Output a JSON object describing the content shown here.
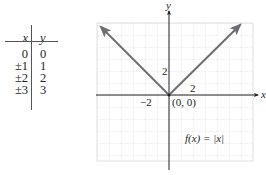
{
  "table": {
    "headers": {
      "x": "x",
      "y": "y"
    },
    "rows": [
      {
        "x": "0",
        "y": "0"
      },
      {
        "x": "±1",
        "y": "1"
      },
      {
        "x": "±2",
        "y": "2"
      },
      {
        "x": "±3",
        "y": "3"
      }
    ]
  },
  "graph": {
    "x_axis_label": "x",
    "y_axis_label": "y",
    "tick_label_x_neg": "−2",
    "tick_label_x_pos": "2",
    "tick_label_y_pos": "2",
    "origin_label": "(0, 0)",
    "function_label": "f(x) = |x|",
    "colors": {
      "curve": "#6d6e71",
      "axis": "#231f20",
      "grid": "#d9d9d9"
    }
  }
}
